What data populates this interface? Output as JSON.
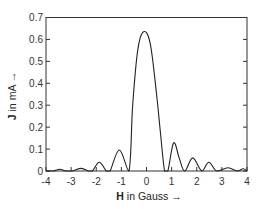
{
  "chart_data": {
    "type": "line",
    "title": "",
    "xlabel": "H in Gauss →",
    "xlabel_bold": "H",
    "xlabel_rest": " in Gauss →",
    "ylabel": "J in mA →",
    "ylabel_bold": "J",
    "ylabel_rest": " in mA →",
    "xlim": [
      -4,
      4
    ],
    "ylim": [
      0,
      0.7
    ],
    "xticks": [
      -4,
      -3,
      -2,
      -1,
      0,
      1,
      2,
      3,
      4
    ],
    "xtick_labels": [
      "-4",
      "-3",
      "-2",
      "-1",
      "0",
      "1",
      "2",
      "3",
      "4"
    ],
    "yticks": [
      0,
      0.1,
      0.2,
      0.3,
      0.4,
      0.5,
      0.6,
      0.7
    ],
    "ytick_labels": [
      "0",
      "0.1",
      "0.2",
      "0.3",
      "0.4",
      "0.5",
      "0.6",
      "0.7"
    ],
    "grid": false,
    "legend": null,
    "series": [
      {
        "name": "J(H)",
        "color": "#222222",
        "x": [
          -4.0,
          -3.7,
          -3.45,
          -3.2,
          -2.95,
          -2.6,
          -2.3,
          -2.15,
          -1.88,
          -1.6,
          -1.45,
          -1.08,
          -0.7,
          -0.55,
          -0.35,
          -0.12,
          0.15,
          0.4,
          0.55,
          0.72,
          0.85,
          1.08,
          1.3,
          1.52,
          1.84,
          2.2,
          2.48,
          2.8,
          3.24,
          3.6,
          3.85,
          4.0
        ],
        "y": [
          0.0,
          0.0,
          0.008,
          0.0,
          0.0,
          0.012,
          0.0,
          0.0,
          0.04,
          0.0,
          0.0,
          0.096,
          0.0,
          0.3,
          0.55,
          0.635,
          0.58,
          0.35,
          0.18,
          0.0,
          0.0,
          0.128,
          0.06,
          0.0,
          0.06,
          0.0,
          0.04,
          0.0,
          0.015,
          0.0,
          0.01,
          0.0
        ]
      }
    ]
  }
}
